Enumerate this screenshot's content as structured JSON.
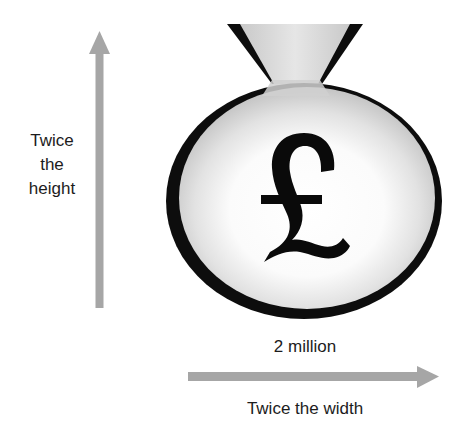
{
  "diagram": {
    "title": "",
    "money_bag": {
      "symbol": "£",
      "amount_label": "2 million",
      "outline_color": "#0d0d0d",
      "fill_light": "#ffffff",
      "fill_shade": "#bdbdbd"
    },
    "vertical_arrow": {
      "label_lines": [
        "Twice",
        "the",
        "height"
      ],
      "color": "#a6a6a6"
    },
    "horizontal_arrow": {
      "label": "Twice the width",
      "color": "#a6a6a6"
    }
  }
}
